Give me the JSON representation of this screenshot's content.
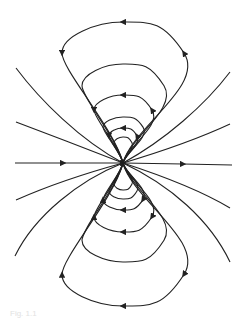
{
  "figure": {
    "caption": "Fig. 1.1",
    "center": {
      "x": 123,
      "y": 163
    },
    "line_color": "#222222",
    "loops": [
      {
        "rx": 61,
        "top": 22,
        "bottom": 306,
        "arrow_top": "left",
        "arrow_bottom": "left"
      },
      {
        "rx": 41,
        "top": 64,
        "bottom": 262,
        "arrow_top": "none",
        "arrow_bottom": "none"
      },
      {
        "rx": 29,
        "top": 95,
        "bottom": 232,
        "arrow_top": "left",
        "arrow_bottom": "left"
      },
      {
        "rx": 20,
        "top": 117,
        "bottom": 210,
        "arrow_top": "none",
        "arrow_bottom": "left"
      },
      {
        "rx": 14,
        "top": 128,
        "bottom": 199,
        "arrow_top": "left",
        "arrow_bottom": "none"
      },
      {
        "rx": 9,
        "top": 137,
        "bottom": 190,
        "arrow_top": "none",
        "arrow_bottom": "none"
      }
    ],
    "axis_line": {
      "x1": 15,
      "x2": 232,
      "arrows": [
        "right",
        "right"
      ]
    }
  }
}
